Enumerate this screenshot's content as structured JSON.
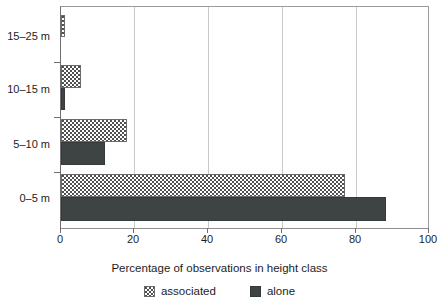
{
  "chart_data": {
    "type": "bar",
    "orientation": "horizontal",
    "title": "",
    "xlabel": "Percentage of observations in height class",
    "ylabel": "",
    "xlim": [
      0,
      100
    ],
    "xticks": [
      0,
      20,
      40,
      60,
      80,
      100
    ],
    "xticklabels": [
      "0",
      "20",
      "40",
      "60",
      "80",
      "100"
    ],
    "categories": [
      "0–5 m",
      "5–10 m",
      "10–15 m",
      "15–25 m"
    ],
    "grid": "vertical",
    "legend_position": "bottom-center",
    "series": [
      {
        "name": "associated",
        "fill": "stipple",
        "color": "#ffffff",
        "values": [
          77,
          18,
          5.5,
          1
        ]
      },
      {
        "name": "alone",
        "fill": "solid",
        "color": "#3e4444",
        "values": [
          88,
          12,
          1,
          0
        ]
      }
    ]
  },
  "axis": {
    "x_title": "Percentage of observations in height class",
    "x_tick_labels": [
      "0",
      "20",
      "40",
      "60",
      "80",
      "100"
    ],
    "y_tick_labels": [
      "15–25 m",
      "10–15 m",
      "5–10 m",
      "0–5 m"
    ]
  },
  "legend": {
    "items": [
      {
        "label": "associated",
        "swatch": "stipple-swatch"
      },
      {
        "label": "alone",
        "swatch": "solid-dark-swatch"
      }
    ]
  },
  "colors": {
    "alone": "#3e4444",
    "associated": "#ffffff",
    "gridline": "#c9c9c9",
    "axis": "#6f6f6f",
    "text": "#1d1d1d"
  }
}
